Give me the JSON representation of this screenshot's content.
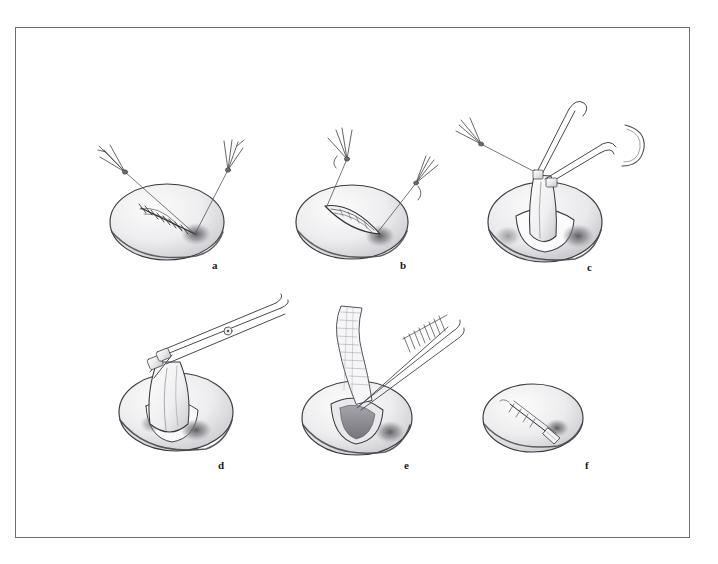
{
  "figure": {
    "domain": "medical-surgical-illustration",
    "style": "pencil-graphite-line-drawing",
    "background_color": "#ffffff",
    "frame_color": "#6e6e72",
    "ink_color": "#3a3a3f",
    "shading_color": "#b9b9bd",
    "panel_count": 6,
    "title": "",
    "caption": ""
  },
  "panels": [
    {
      "id": "a",
      "label": "a",
      "label_x": 212,
      "label_y": 260,
      "description": "Oval tissue mass with a sutured incision line; two suture threads held upward by two forceps",
      "instruments": [
        "forceps-left",
        "forceps-right"
      ],
      "elements": [
        "tissue-oval",
        "suture-line",
        "thread-left",
        "thread-right",
        "shadow-patch"
      ]
    },
    {
      "id": "b",
      "label": "b",
      "label_x": 400,
      "label_y": 260,
      "description": "Sutures drawn apart so the incision opens into a slit; left forceps raised, right forceps lowered",
      "instruments": [
        "forceps-upper-left",
        "forceps-right"
      ],
      "elements": [
        "tissue-oval",
        "open-incision",
        "thread-left",
        "thread-right",
        "shadow-patch"
      ]
    },
    {
      "id": "c",
      "label": "c",
      "label_x": 587,
      "label_y": 262,
      "description": "Tissue edge elevated and grasped with a clamp and forceps; suture thread runs off to the left forceps; curved needle at upper right",
      "instruments": [
        "forceps-left",
        "hemostat-clamp",
        "curved-needle"
      ],
      "elements": [
        "tissue-oval",
        "elevated-tissue-flap",
        "thread-left",
        "clamp-jaws",
        "shadow-patch"
      ]
    },
    {
      "id": "d",
      "label": "d",
      "label_x": 218,
      "label_y": 460,
      "description": "Scissors transecting the elevated tissue flap held by the clamp",
      "instruments": [
        "scissors",
        "clamp"
      ],
      "elements": [
        "tissue-oval",
        "elevated-tissue-flap",
        "scissor-blades",
        "scissor-pivot-screw",
        "shadow-patch"
      ]
    },
    {
      "id": "e",
      "label": "e",
      "label_x": 404,
      "label_y": 460,
      "description": "Gauze wick / drain strip being introduced into the open cavity with long forceps",
      "instruments": [
        "long-forceps",
        "gauze-strip"
      ],
      "elements": [
        "tissue-oval",
        "open-cavity",
        "gauze-strip",
        "forceps-shaft",
        "shadow-patch"
      ]
    },
    {
      "id": "f",
      "label": "f",
      "label_x": 585,
      "label_y": 460,
      "description": "Final result: the wound with the drain wick left protruding from the incision",
      "instruments": [],
      "elements": [
        "tissue-oval",
        "closed-incision",
        "protruding-wick"
      ]
    }
  ]
}
